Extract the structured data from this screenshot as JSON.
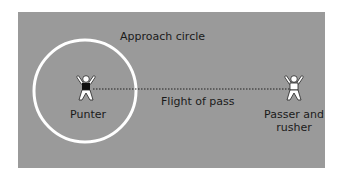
{
  "diagram": {
    "labels": {
      "approach_circle": "Approach circle",
      "punter": "Punter",
      "flight_of_pass": "Flight of pass",
      "passer_line1": "Passer and",
      "passer_line2": "rusher"
    },
    "colors": {
      "background": "#9a9a9a",
      "circle": "#ffffff",
      "figure_fill": "#ffffff",
      "punter_shirt": "#111111",
      "dotted_line": "#222222"
    }
  }
}
